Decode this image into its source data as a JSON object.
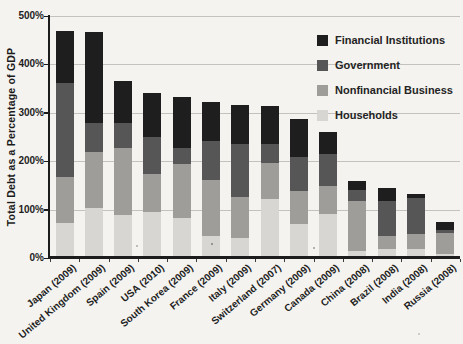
{
  "figure": {
    "background_color": "#f4f3ef",
    "axis_color": "#1c1c1c",
    "gridline_color": "#c3c2be"
  },
  "chart_data": {
    "type": "bar",
    "stacked": true,
    "title": "",
    "ylabel": "Total Debt as a Percentage of GDP",
    "xlabel": "",
    "ylim": [
      0,
      500
    ],
    "yticks": [
      0,
      100,
      200,
      300,
      400,
      500
    ],
    "ytick_labels": [
      "0%",
      "100%",
      "200%",
      "300%",
      "400%",
      "500%"
    ],
    "grid": "horizontal",
    "legend_position": "top-right",
    "legend_order": [
      "Financial Institutions",
      "Government",
      "Nonfinancial Business",
      "Households"
    ],
    "categories": [
      "Japan (2009)",
      "United Kingdom (2009)",
      "Spain (2009)",
      "USA (2010)",
      "South Korea (2009)",
      "France (2009)",
      "Italy (2009)",
      "Switzerland (2007)",
      "Germany (2009)",
      "Canada (2009)",
      "China (2008)",
      "Brazil (2008)",
      "India (2008)",
      "Russia (2008)"
    ],
    "series": [
      {
        "name": "Households",
        "color": "#d7d6d2",
        "values": [
          72,
          104,
          88,
          95,
          82,
          45,
          41,
          122,
          70,
          91,
          15,
          19,
          19,
          8
        ]
      },
      {
        "name": "Nonfinancial Business",
        "color": "#9e9d9a",
        "values": [
          95,
          115,
          139,
          79,
          112,
          117,
          85,
          75,
          68,
          58,
          102,
          26,
          31,
          44
        ]
      },
      {
        "name": "Government",
        "color": "#565656",
        "values": [
          195,
          59,
          52,
          76,
          33,
          80,
          110,
          38,
          70,
          66,
          24,
          73,
          73,
          5
        ]
      },
      {
        "name": "Financial Institutions",
        "color": "#1e1e1e",
        "values": [
          108,
          188,
          87,
          90,
          106,
          81,
          80,
          80,
          80,
          45,
          19,
          26,
          10,
          18
        ]
      }
    ],
    "totals": [
      470,
      466,
      366,
      340,
      333,
      323,
      316,
      315,
      288,
      260,
      160,
      144,
      133,
      75
    ]
  }
}
